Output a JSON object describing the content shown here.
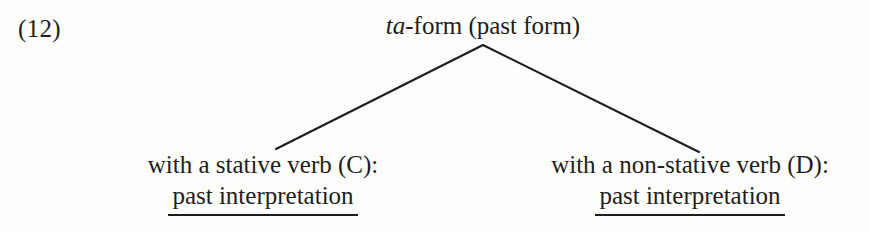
{
  "figure": {
    "example_number": "(12)",
    "root": {
      "italic_part": "ta",
      "rest": "-form (past form)"
    },
    "branches": [
      {
        "name": "left-branch",
        "from_x": 483,
        "from_y": 45,
        "to_x": 276,
        "to_y": 149
      },
      {
        "name": "right-branch",
        "from_x": 483,
        "from_y": 45,
        "to_x": 699,
        "to_y": 152
      }
    ],
    "leaves": [
      {
        "id": "C",
        "line1": "with a stative verb (C):",
        "line2": "past interpretation",
        "line2_underlined": true
      },
      {
        "id": "D",
        "line1": "with a non-stative verb (D):",
        "line2": "past interpretation",
        "line2_underlined": true
      }
    ],
    "colors": {
      "ink": "#1d1d1d",
      "paper": "#fdfdfb"
    }
  }
}
